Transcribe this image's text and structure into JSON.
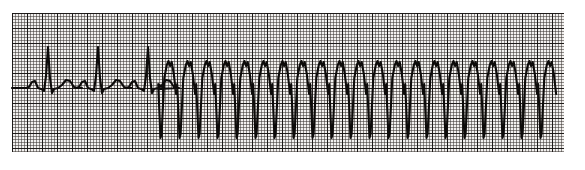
{
  "strip": {
    "title": "ECG rhythm strip",
    "description": "Single-lead rhythm strip showing three sinus beats followed by sustained wide-complex (ventricular) tachycardia",
    "width_px": 585,
    "height_px": 170
  },
  "paper": {
    "name": "ecg-graph-paper",
    "background_color": "#f2f0ee",
    "fine_grid_color": "#3c3734",
    "bold_grid_color": "#191614",
    "fine_grid_spacing_px": 3,
    "bold_grid_spacing_px": 15,
    "left_px": 12,
    "top_px": 13,
    "width_px": 552,
    "height_px": 139
  },
  "trace": {
    "name": "ecg-waveform",
    "color": "#0d0b0a",
    "stroke_width_px": 2.1,
    "baseline_y_px": 88,
    "start_x_px": 12,
    "end_x_px": 585
  },
  "chart_data": {
    "type": "line",
    "xlabel": "Time",
    "ylabel": "Amplitude",
    "grid": true,
    "legend_position": "none",
    "axis_units": {
      "x": "0.04 s per small square (3 px)",
      "y": "0.1 mV per small square (3 px)"
    },
    "xlim": [
      12,
      585
    ],
    "ylim": [
      13,
      152
    ],
    "baseline_y": 88,
    "segments": [
      {
        "name": "sinus-rhythm",
        "label": "Normal sinus beats",
        "beat_count": 3,
        "beat_x_positions": [
          48,
          98,
          148
        ],
        "rr_interval_px": 50,
        "r_peak_y": 47,
        "p_wave_y": 82,
        "t_wave_y": 80,
        "s_wave_y": 93
      },
      {
        "name": "ventricular-tachycardia",
        "label": "Wide complex tachycardia",
        "onset_x": 170,
        "beat_count": 21,
        "cycle_length_px": 19,
        "peak_y": 61,
        "trough_y": 138,
        "notch_y": 66
      }
    ]
  }
}
